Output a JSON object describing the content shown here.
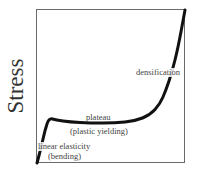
{
  "chart_data": {
    "type": "line",
    "title": "",
    "xlabel": "",
    "ylabel": "Stress",
    "grid": false,
    "legend": null,
    "series": [
      {
        "name": "stress-strain curve",
        "color": "#111111",
        "points_px": [
          [
            37,
            163
          ],
          [
            41,
            148
          ],
          [
            45,
            130
          ],
          [
            49,
            118
          ],
          [
            56,
            120
          ],
          [
            70,
            122
          ],
          [
            90,
            123
          ],
          [
            115,
            123
          ],
          [
            135,
            121
          ],
          [
            150,
            115
          ],
          [
            160,
            104
          ],
          [
            166,
            90
          ],
          [
            172,
            72
          ],
          [
            178,
            48
          ],
          [
            185,
            10
          ]
        ]
      }
    ],
    "annotations": [
      {
        "id": "densification",
        "text": "densification"
      },
      {
        "id": "plateau",
        "text": "plateau"
      },
      {
        "id": "plastic",
        "text": "(plastic yielding)"
      },
      {
        "id": "linear",
        "text": "linear elasticity"
      },
      {
        "id": "bending",
        "text": "(bending)"
      }
    ]
  },
  "labels": {
    "ylabel": "Stress",
    "densification": "densification",
    "plateau": "plateau",
    "plastic": "(plastic yielding)",
    "linear": "linear elasticity",
    "bending": "(bending)"
  }
}
